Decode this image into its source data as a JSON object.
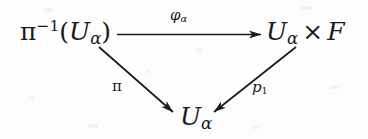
{
  "diagram": {
    "kind": "commutative-triangle",
    "background_color": "#fdfdfd",
    "ink_color": "#1a1a1a",
    "nodes": [
      {
        "id": "total-space",
        "name": "preimage-node",
        "latex": "\\pi^{-1}(U_\\alpha)",
        "parts": {
          "base": "π",
          "exponent": "−1",
          "open_paren": "(",
          "letter": "U",
          "subscript": "α",
          "close_paren": ")"
        },
        "position": "top-left"
      },
      {
        "id": "product",
        "name": "product-node",
        "latex": "U_\\alpha \\times F",
        "parts": {
          "letter": "U",
          "subscript": "α",
          "times": "×",
          "fiber": "F"
        },
        "position": "top-right"
      },
      {
        "id": "base",
        "name": "base-node",
        "latex": "U_\\alpha",
        "parts": {
          "letter": "U",
          "subscript": "α"
        },
        "position": "bottom-center"
      }
    ],
    "edges": [
      {
        "id": "phi-alpha",
        "name": "horizontal-arrow",
        "from": "total-space",
        "to": "product",
        "label_latex": "\\varphi_\\alpha",
        "label_parts": {
          "symbol": "φ",
          "subscript": "α"
        },
        "style": "solid",
        "arrowhead": "single",
        "direction": "right"
      },
      {
        "id": "pi",
        "name": "left-diagonal-arrow",
        "from": "total-space",
        "to": "base",
        "label_latex": "\\pi",
        "label_parts": {
          "symbol": "π",
          "subscript": ""
        },
        "style": "solid",
        "arrowhead": "single",
        "direction": "down-right"
      },
      {
        "id": "p1",
        "name": "right-diagonal-arrow",
        "from": "product",
        "to": "base",
        "label_latex": "p_1",
        "label_parts": {
          "symbol": "p",
          "subscript": "1"
        },
        "style": "solid",
        "arrowhead": "single",
        "direction": "down-left"
      }
    ]
  }
}
